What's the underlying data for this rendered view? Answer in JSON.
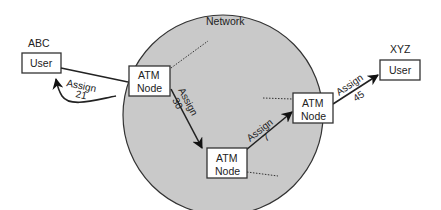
{
  "diagram": {
    "network_label": "Network",
    "colors": {
      "network_fill": "#c9c9c9",
      "network_stroke": "#333333"
    },
    "users": [
      {
        "id": "abc",
        "name": "ABC",
        "label": "User"
      },
      {
        "id": "xyz",
        "name": "XYZ",
        "label": "User"
      }
    ],
    "nodes": [
      {
        "id": "node1",
        "line1": "ATM",
        "line2": "Node"
      },
      {
        "id": "node2",
        "line1": "ATM",
        "line2": "Node"
      },
      {
        "id": "node3",
        "line1": "ATM",
        "line2": "Node"
      }
    ],
    "links": [
      {
        "from": "node1",
        "to": "abc",
        "assign_label": "Assign",
        "value": "21"
      },
      {
        "from": "node1",
        "to": "node2",
        "assign_label": "Assign",
        "value": "30"
      },
      {
        "from": "node2",
        "to": "node3",
        "assign_label": "Assign",
        "value": "7"
      },
      {
        "from": "node3",
        "to": "xyz",
        "assign_label": "Assign",
        "value": "45"
      }
    ]
  }
}
